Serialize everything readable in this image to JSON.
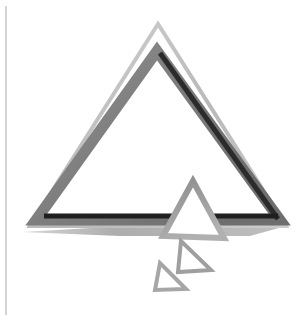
{
  "image": {
    "width": 305,
    "height": 321,
    "background_color": "#ffffff",
    "subject": "abstract grayscale nested triangle logo with descending smaller triangles",
    "palette": {
      "background": "#ffffff",
      "light_gray": "#c9c9c9",
      "mid_gray": "#8f8f8f",
      "gray": "#7e7e7e",
      "dark_gray": "#4a4a4a",
      "near_black": "#2b2b2b",
      "black": "#1a1a1a",
      "rule_gray": "#a8a8a8"
    }
  },
  "frame": {
    "left_rule": {
      "name": "vertical-rule",
      "x": 6,
      "y_start": 6,
      "y_end": 315,
      "color": "#a8a8a8",
      "width": 1
    }
  },
  "shapes": {
    "outer_triangle": {
      "name": "outer-triangle-outline",
      "apex": [
        158,
        24
      ],
      "left_base": [
        30,
        226
      ],
      "right_base": [
        286,
        226
      ],
      "stroke_color": "#bdbdbd",
      "stroke_width": 4,
      "fill": "none"
    },
    "inner_triangle": {
      "name": "inner-triangle-outline",
      "apex": [
        157,
        51
      ],
      "left_base": [
        36,
        220
      ],
      "right_base": [
        280,
        220
      ],
      "stroke_color": "#7e7e7e",
      "stroke_width": 11,
      "fill": "none"
    },
    "inner_triangle_dark_edge": {
      "name": "inner-triangle-dark-right-edge",
      "from": [
        160,
        53
      ],
      "to": [
        278,
        219
      ],
      "stroke_color": "#2b2b2b",
      "stroke_width": 5
    },
    "inner_triangle_dark_base": {
      "name": "inner-triangle-dark-bottom-bar",
      "from": [
        44,
        216
      ],
      "to": [
        278,
        216
      ],
      "stroke_color": "#1f1f1f",
      "stroke_width": 5
    },
    "shadow_wedge": {
      "name": "shadow-wedge",
      "points": "22,232 160,224 286,226 250,236 120,236",
      "fill": "#b4b4b4"
    },
    "medium_triangle": {
      "name": "medium-triangle-outline",
      "apex": [
        193,
        181
      ],
      "left_base": [
        163,
        236
      ],
      "right_base": [
        224,
        238
      ],
      "stroke_color": "#9a9a9a",
      "stroke_width": 6,
      "fill": "#ffffff"
    },
    "small_triangle": {
      "name": "small-triangle-outline",
      "apex": [
        181,
        241
      ],
      "left_base": [
        178,
        272
      ],
      "right_base": [
        211,
        270
      ],
      "stroke_color": "#9f9f9f",
      "stroke_width": 4,
      "fill": "#ffffff"
    },
    "tiny_triangle": {
      "name": "tiny-triangle-outline",
      "apex": [
        160,
        263
      ],
      "left_base": [
        155,
        290
      ],
      "right_base": [
        186,
        289
      ],
      "stroke_color": "#a6a6a6",
      "stroke_width": 4,
      "fill": "#ffffff"
    }
  },
  "labels": {
    "canvas_title": "Abstract Triangle Graphic",
    "alt_text": "Grayscale abstract logo: nested triangle outlines with three descending smaller triangles"
  }
}
